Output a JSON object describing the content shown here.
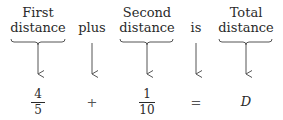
{
  "diagram": {
    "columns": [
      {
        "label_line1": "First",
        "label_line2": "distance",
        "has_brace": true,
        "maps_to": {
          "type": "fraction",
          "numerator": "4",
          "denominator": "5"
        }
      },
      {
        "label_line1": "",
        "label_line2": "plus",
        "has_brace": false,
        "maps_to": {
          "type": "operator",
          "symbol": "+"
        }
      },
      {
        "label_line1": "Second",
        "label_line2": "distance",
        "has_brace": true,
        "maps_to": {
          "type": "fraction",
          "numerator": "1",
          "denominator": "10"
        }
      },
      {
        "label_line1": "",
        "label_line2": "is",
        "has_brace": false,
        "maps_to": {
          "type": "operator",
          "symbol": "="
        }
      },
      {
        "label_line1": "Total",
        "label_line2": "distance",
        "has_brace": true,
        "maps_to": {
          "type": "variable",
          "symbol": "D"
        }
      }
    ],
    "equation": "4/5 + 1/10 = D",
    "colors": {
      "ink": "#2a2a2a",
      "arrow": "#555555"
    }
  }
}
